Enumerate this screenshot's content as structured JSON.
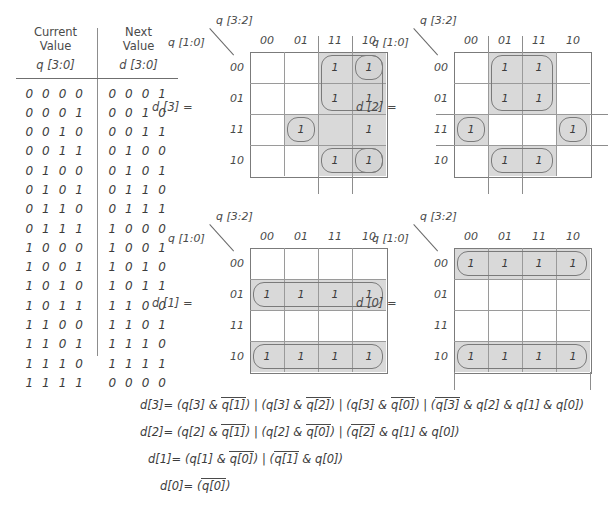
{
  "truth_table": {
    "header_left": "Current Value",
    "header_left_line1": "Current",
    "header_left_line2": "Value",
    "header_left_signal": "q [3:0]",
    "header_right_line1": "Next",
    "header_right_line2": "Value",
    "header_right_signal": "d [3:0]",
    "rows": [
      {
        "current": "0 0 0 0",
        "next": "0 0 0 1"
      },
      {
        "current": "0 0 0 1",
        "next": "0 0 1 0"
      },
      {
        "current": "0 0 1 0",
        "next": "0 0 1 1"
      },
      {
        "current": "0 0 1 1",
        "next": "0 1 0 0"
      },
      {
        "current": "0 1 0 0",
        "next": "0 1 0 1"
      },
      {
        "current": "0 1 0 1",
        "next": "0 1 1 0"
      },
      {
        "current": "0 1 1 0",
        "next": "0 1 1 1"
      },
      {
        "current": "0 1 1 1",
        "next": "1 0 0 0"
      },
      {
        "current": "1 0 0 0",
        "next": "1 0 0 1"
      },
      {
        "current": "1 0 0 1",
        "next": "1 0 1 0"
      },
      {
        "current": "1 0 1 0",
        "next": "1 0 1 1"
      },
      {
        "current": "1 0 1 1",
        "next": "1 1 0 0"
      },
      {
        "current": "1 1 0 0",
        "next": "1 1 0 1"
      },
      {
        "current": "1 1 0 1",
        "next": "1 1 1 0"
      },
      {
        "current": "1 1 1 0",
        "next": "1 1 1 1"
      },
      {
        "current": "1 1 1 1",
        "next": "0 0 0 0"
      }
    ]
  },
  "kmaps": [
    {
      "id": "d3",
      "col_axis_label": "q [3:2]",
      "row_axis_label": "q [1:0]",
      "output_label": "d [3] =",
      "col_headers": [
        "00",
        "01",
        "11",
        "10"
      ],
      "row_headers": [
        "00",
        "01",
        "11",
        "10"
      ],
      "cells": [
        [
          "",
          "",
          "1",
          "1"
        ],
        [
          "",
          "",
          "1",
          "1"
        ],
        [
          "",
          "1",
          "",
          "1"
        ],
        [
          "",
          "",
          "1",
          "1"
        ]
      ]
    },
    {
      "id": "d2",
      "col_axis_label": "q [3:2]",
      "row_axis_label": "q [1:0]",
      "output_label": "d [2] =",
      "col_headers": [
        "00",
        "01",
        "11",
        "10"
      ],
      "row_headers": [
        "00",
        "01",
        "11",
        "10"
      ],
      "cells": [
        [
          "",
          "1",
          "1",
          ""
        ],
        [
          "",
          "1",
          "1",
          ""
        ],
        [
          "1",
          "",
          "",
          "1"
        ],
        [
          "",
          "1",
          "1",
          ""
        ]
      ]
    },
    {
      "id": "d1",
      "col_axis_label": "q [3:2]",
      "row_axis_label": "q [1:0]",
      "output_label": "d [1] =",
      "col_headers": [
        "00",
        "01",
        "11",
        "10"
      ],
      "row_headers": [
        "00",
        "01",
        "11",
        "10"
      ],
      "cells": [
        [
          "",
          "",
          "",
          ""
        ],
        [
          "1",
          "1",
          "1",
          "1"
        ],
        [
          "",
          "",
          "",
          ""
        ],
        [
          "1",
          "1",
          "1",
          "1"
        ]
      ]
    },
    {
      "id": "d0",
      "col_axis_label": "q [3:2]",
      "row_axis_label": "q [1:0]",
      "output_label": "d [0] =",
      "col_headers": [
        "00",
        "01",
        "11",
        "10"
      ],
      "row_headers": [
        "00",
        "01",
        "11",
        "10"
      ],
      "cells": [
        [
          "1",
          "1",
          "1",
          "1"
        ],
        [
          "",
          "",
          "",
          ""
        ],
        [
          "",
          "",
          "",
          ""
        ],
        [
          "1",
          "1",
          "1",
          "1"
        ]
      ]
    }
  ],
  "equations": {
    "d3": "d[3]= (q[3] & q[1]) | (q[3] & q[2]) | (q[3] & q[0]) | (q[3] & q[2] & q[1] & q[0])",
    "d2": "d[2]= (q[2] & q[1]) | (q[2] & q[0]) | (q[2] & q[1] & q[0])",
    "d1": "d[1]= (q[1] & q[0]) | (q[1] & q[0])",
    "d0": "d[0]= (q[0])",
    "parts": {
      "d3_lhs": "d[3]=",
      "d2_lhs": "d[2]=",
      "d1_lhs": "d[1]=",
      "d0_lhs": "d[0]=",
      "q3": "q[3]",
      "q2": "q[2]",
      "q1": "q[1]",
      "q0": "q[0]",
      "and": "&",
      "or": "|",
      "lp": "(",
      "rp": ")"
    }
  },
  "colors": {
    "shade": "#d2d2d2",
    "grid_line": "#9a9a9a",
    "loop_border": "#7a7a7a",
    "text": "#3c3c3c",
    "background": "#ffffff"
  }
}
